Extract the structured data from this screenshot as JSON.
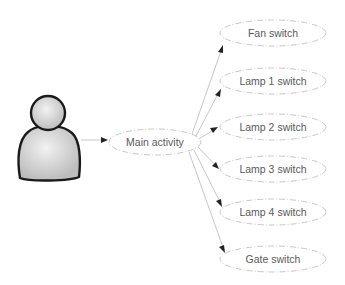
{
  "diagram": {
    "type": "use-case",
    "actor": {
      "name": "user-actor",
      "label": ""
    },
    "main_node": {
      "label": "Main activity",
      "cx": 155,
      "cy": 142,
      "rx": 46,
      "ry": 13
    },
    "nodes": [
      {
        "label": "Fan switch",
        "cx": 273,
        "cy": 33
      },
      {
        "label": "Lamp 1 switch",
        "cx": 273,
        "cy": 81
      },
      {
        "label": "Lamp 2 switch",
        "cx": 273,
        "cy": 127
      },
      {
        "label": "Lamp 3 switch",
        "cx": 273,
        "cy": 169
      },
      {
        "label": "Lamp 4 switch",
        "cx": 273,
        "cy": 212
      },
      {
        "label": "Gate switch",
        "cx": 273,
        "cy": 259
      }
    ],
    "edges": [
      {
        "from": "actor",
        "to": "Main activity"
      },
      {
        "from": "Main activity",
        "to": "Fan switch"
      },
      {
        "from": "Main activity",
        "to": "Lamp 1 switch"
      },
      {
        "from": "Main activity",
        "to": "Lamp 2 switch"
      },
      {
        "from": "Main activity",
        "to": "Lamp 3 switch"
      },
      {
        "from": "Main activity",
        "to": "Lamp 4 switch"
      },
      {
        "from": "Main activity",
        "to": "Gate switch"
      }
    ],
    "colors": {
      "ellipse_stroke": "#c8c8c8",
      "edge": "#b8b8b8",
      "arrowhead": "#222222",
      "text": "#5a5a5a",
      "actor_fill": "#d8d8d8",
      "actor_stroke": "#1a1a1a"
    }
  }
}
